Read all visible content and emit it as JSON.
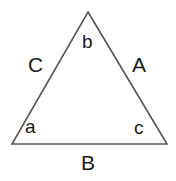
{
  "figure": {
    "background_color": "#ffffff",
    "stroke_color": "#555555",
    "text_color": "#1a1a1a"
  },
  "triangle": {
    "points": "88,12 167,144 12,144",
    "vertices": {
      "apex": {
        "x": 88,
        "y": 12
      },
      "bottom_left": {
        "x": 12,
        "y": 144
      },
      "bottom_right": {
        "x": 167,
        "y": 144
      }
    }
  },
  "labels": {
    "sides": {
      "left": "C",
      "right": "A",
      "bottom": "B"
    },
    "angles": {
      "apex": "b",
      "bottom_left": "a",
      "bottom_right": "c"
    }
  }
}
